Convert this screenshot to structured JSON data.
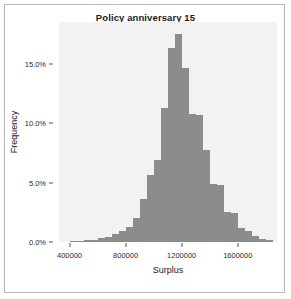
{
  "figure": {
    "title": "Policy anniversary 15",
    "panel_background": "#f2f2f2",
    "bar_color": "#8c8c8c",
    "frame_color": "#b9b9b9"
  },
  "chart_data": {
    "type": "bar",
    "chart_subtype": "histogram",
    "title": "Policy anniversary 15",
    "xlabel": "Surplus",
    "ylabel": "Frequency",
    "grid": false,
    "legend": null,
    "xlim": [
      325000,
      1880000
    ],
    "ylim": [
      0,
      18.5
    ],
    "xticks": [
      400000,
      800000,
      1200000,
      1600000
    ],
    "xtick_labels": [
      "400000",
      "800000",
      "1200000",
      "1600000"
    ],
    "yticks": [
      0,
      5,
      10,
      15
    ],
    "ytick_labels": [
      "0.0%",
      "5.0%",
      "10.0%",
      "15.0%"
    ],
    "y_unit": "percent",
    "bin_width": 50000,
    "bin_centers": [
      425000,
      475000,
      525000,
      575000,
      625000,
      675000,
      725000,
      775000,
      825000,
      875000,
      925000,
      975000,
      1025000,
      1075000,
      1125000,
      1175000,
      1225000,
      1275000,
      1325000,
      1375000,
      1425000,
      1475000,
      1525000,
      1575000,
      1625000,
      1675000,
      1725000,
      1775000,
      1825000
    ],
    "values": [
      0.1,
      0.1,
      0.15,
      0.2,
      0.3,
      0.45,
      0.7,
      0.9,
      1.3,
      2.0,
      3.6,
      5.6,
      6.9,
      11.3,
      16.3,
      17.5,
      14.6,
      10.8,
      10.7,
      7.7,
      4.9,
      4.8,
      2.5,
      2.4,
      1.2,
      0.9,
      0.5,
      0.25,
      0.15
    ]
  }
}
